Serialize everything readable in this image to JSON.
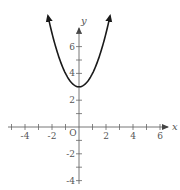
{
  "chart_data": {
    "type": "line",
    "title": "",
    "xlabel": "x",
    "ylabel": "y",
    "function": "y = x^2 + 3",
    "vertex": [
      0,
      3
    ],
    "origin_label": "O",
    "xlim": [
      -5.5,
      6.5
    ],
    "ylim": [
      -5,
      7
    ],
    "x_ticks": [
      -4,
      -2,
      2,
      4,
      6
    ],
    "x_tick_labels": [
      "-4",
      "-2",
      "2",
      "4",
      "6"
    ],
    "y_ticks": [
      -4,
      -2,
      2,
      4,
      6
    ],
    "y_tick_labels": [
      "-4",
      "-2",
      "2",
      "4",
      "6"
    ],
    "grid": false,
    "series": [
      {
        "name": "parabola",
        "x": [
          -2.3,
          -2,
          -1.5,
          -1,
          -0.5,
          0,
          0.5,
          1,
          1.5,
          2,
          2.3
        ],
        "y": [
          8.29,
          7,
          5.25,
          4,
          3.25,
          3,
          3.25,
          4,
          5.25,
          7,
          8.29
        ]
      }
    ],
    "colors": {
      "curve": "#1a1a1a",
      "axes": "#666666",
      "labels": "#555555"
    }
  }
}
